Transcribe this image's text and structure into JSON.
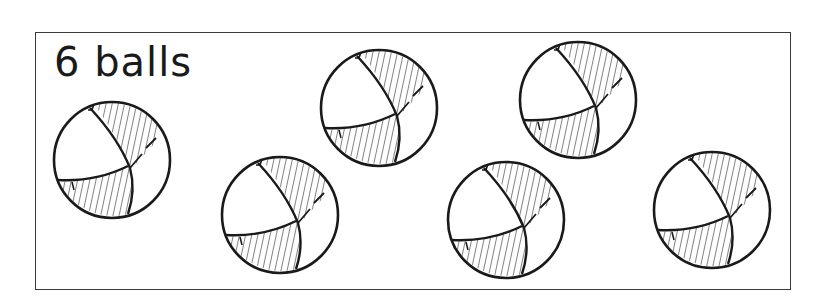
{
  "card": {
    "title": "6 balls",
    "count": 6
  },
  "balls": [
    {
      "id": 1,
      "cx": 112,
      "cy": 160,
      "r": 58
    },
    {
      "id": 2,
      "cx": 280,
      "cy": 215,
      "r": 59
    },
    {
      "id": 3,
      "cx": 379,
      "cy": 108,
      "r": 59
    },
    {
      "id": 4,
      "cx": 506,
      "cy": 220,
      "r": 59
    },
    {
      "id": 5,
      "cx": 578,
      "cy": 100,
      "r": 58
    },
    {
      "id": 6,
      "cx": 712,
      "cy": 210,
      "r": 59
    }
  ],
  "colors": {
    "ink": "#1a1a1a",
    "frame": "#3a3a3a",
    "background": "#ffffff"
  }
}
